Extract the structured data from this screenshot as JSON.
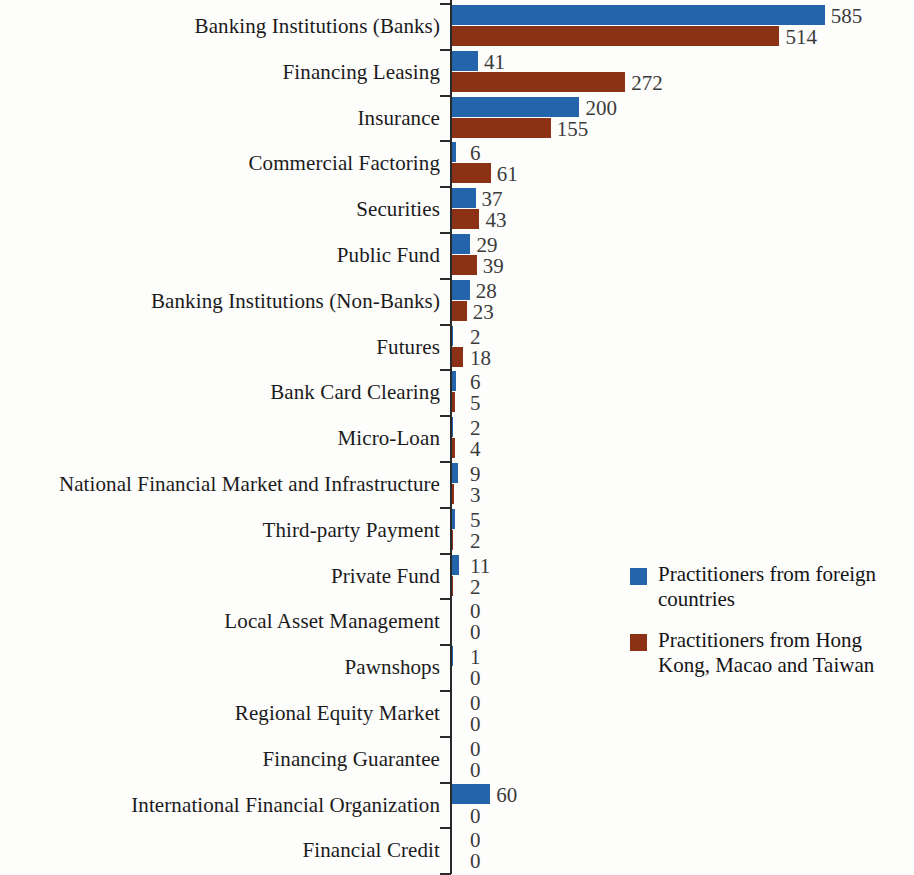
{
  "chart_data": {
    "type": "bar",
    "orientation": "horizontal",
    "title": "",
    "subtitle": "",
    "xlabel": "",
    "ylabel": "",
    "grid": false,
    "legend_position": "middle-right",
    "xlim": [
      0,
      585
    ],
    "colors": {
      "series_1": "#2464ab",
      "series_2": "#8b3115"
    },
    "categories": [
      "Banking Institutions (Banks)",
      "Financing Leasing",
      "Insurance",
      "Commercial Factoring",
      "Securities",
      "Public Fund",
      "Banking Institutions (Non-Banks)",
      "Futures",
      "Bank Card Clearing",
      "Micro-Loan",
      "National Financial Market and Infrastructure",
      "Third-party Payment",
      "Private Fund",
      "Local Asset Management",
      "Pawnshops",
      "Regional Equity Market",
      "Financing Guarantee",
      "International Financial Organization",
      "Financial Credit"
    ],
    "series": [
      {
        "name": "Practitioners from foreign countries",
        "color": "#2464ab",
        "values": [
          585,
          41,
          200,
          6,
          37,
          29,
          28,
          2,
          6,
          2,
          9,
          5,
          11,
          0,
          1,
          0,
          0,
          60,
          0
        ]
      },
      {
        "name": "Practitioners from Hong Kong, Macao and Taiwan",
        "color": "#8b3115",
        "values": [
          514,
          272,
          155,
          61,
          43,
          39,
          23,
          18,
          5,
          4,
          3,
          2,
          2,
          0,
          0,
          0,
          0,
          0,
          0
        ]
      }
    ]
  },
  "legend": {
    "entries": [
      {
        "label": "Practitioners from foreign countries",
        "color": "#2464ab",
        "swatch": "blue-square-icon"
      },
      {
        "label": "Practitioners from Hong Kong, Macao and Taiwan",
        "color": "#8b3115",
        "swatch": "red-square-icon"
      }
    ]
  }
}
